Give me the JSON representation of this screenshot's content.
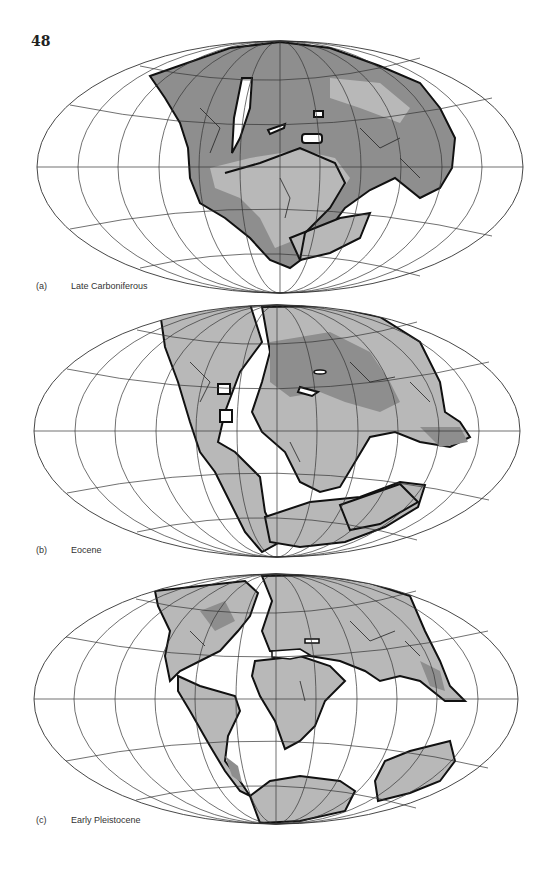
{
  "page": {
    "number": "48"
  },
  "colors": {
    "ocean": "#ffffff",
    "land_light": "#b8b8b8",
    "land_dark": "#8e8e8e",
    "coastline": "#111111",
    "graticule": "#333333"
  },
  "projection": "Mollweide (equal-area, elliptical)",
  "maps": [
    {
      "id": "a",
      "label": "(a)",
      "period": "Late Carboniferous"
    },
    {
      "id": "b",
      "label": "(b)",
      "period": "Eocene"
    },
    {
      "id": "c",
      "label": "(c)",
      "period": "Early Pleistocene"
    }
  ],
  "legend": {
    "land_light": "lowland / continental area (light grey)",
    "land_dark": "shallow sea / flooded continental area (dark grey)"
  }
}
